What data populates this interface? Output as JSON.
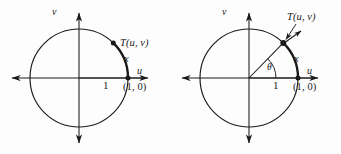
{
  "figure": {
    "background_color": "#fdfdfd",
    "stroke_color": "#1a1a1a",
    "width": 341,
    "height": 154
  },
  "panels": [
    {
      "id": "left",
      "name": "unit-circle-arc-only",
      "circle": {
        "cx": 79,
        "cy": 78,
        "r": 49,
        "label": "unit-circle"
      },
      "axes": {
        "u_label": "u",
        "v_label": "v",
        "u_axis_name": "horizontal-u-axis",
        "v_axis_name": "vertical-v-axis"
      },
      "labels": {
        "point_T": "T(u, v)",
        "arc_x": "x",
        "tick_one": "1",
        "point_one_zero": "(1, 0)"
      },
      "features": {
        "has_radius_line": false,
        "has_theta_arc": false,
        "has_tangent_arrow": false,
        "has_leader_line": false,
        "bold_arc": true
      }
    },
    {
      "id": "right",
      "name": "unit-circle-with-angle-theta",
      "circle": {
        "cx": 79,
        "cy": 78,
        "r": 49,
        "label": "unit-circle"
      },
      "axes": {
        "u_label": "u",
        "v_label": "v",
        "u_axis_name": "horizontal-u-axis",
        "v_axis_name": "vertical-v-axis"
      },
      "labels": {
        "point_T": "T(u, v)",
        "arc_x": "x",
        "tick_one": "1",
        "point_one_zero": "(1, 0)",
        "angle_theta": "θ"
      },
      "features": {
        "has_radius_line": true,
        "has_theta_arc": true,
        "has_tangent_arrow": true,
        "has_leader_line": true,
        "bold_arc": true
      }
    }
  ]
}
